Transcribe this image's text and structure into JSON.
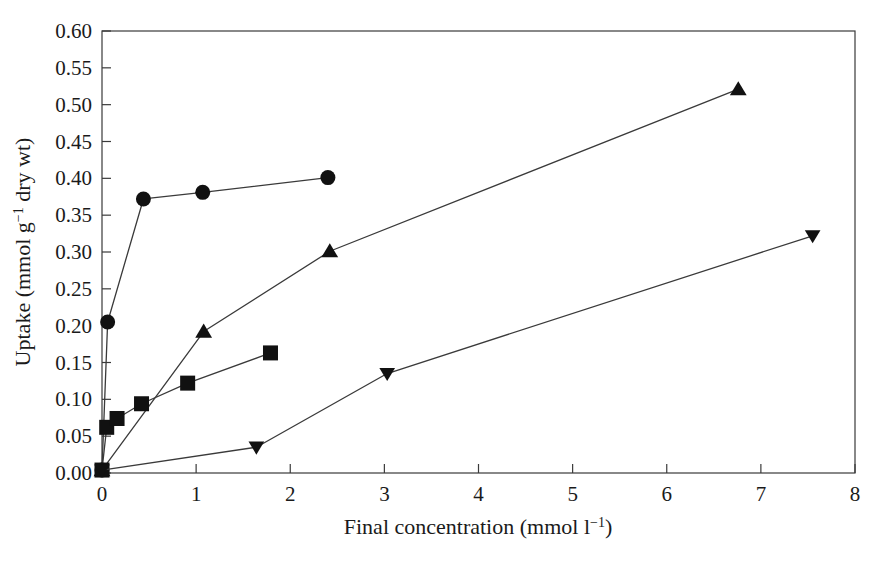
{
  "figure": {
    "background_color": "#ffffff",
    "ink_color": "#111111",
    "axis_color": "#3a3a3a"
  },
  "chart_data": {
    "type": "line",
    "title": "",
    "subtitle": "",
    "xlabel": "Final concentration (mmol l",
    "xlabel_sup": "−1",
    "xlabel_tail": ")",
    "xlabel_full": "Final concentration (mmol l⁻¹)",
    "ylabel_head": "Uptake (mmol g",
    "ylabel_sup": "−1",
    "ylabel_tail": " dry wt)",
    "ylabel_full": "Uptake (mmol g⁻¹ dry wt)",
    "xlim": [
      0,
      8
    ],
    "ylim": [
      0.0,
      0.6
    ],
    "xticks": [
      0,
      1,
      2,
      3,
      4,
      5,
      6,
      7,
      8
    ],
    "xtick_labels": [
      "0",
      "1",
      "2",
      "3",
      "4",
      "5",
      "6",
      "7",
      "8"
    ],
    "yticks": [
      0.0,
      0.05,
      0.1,
      0.15,
      0.2,
      0.25,
      0.3,
      0.35,
      0.4,
      0.45,
      0.5,
      0.55,
      0.6
    ],
    "ytick_labels": [
      "0.00",
      "0.05",
      "0.10",
      "0.15",
      "0.20",
      "0.25",
      "0.30",
      "0.35",
      "0.40",
      "0.45",
      "0.50",
      "0.55",
      "0.60"
    ],
    "grid": false,
    "legend": "none",
    "frame": "box",
    "series": [
      {
        "name": "circle-series",
        "marker": "circle",
        "marker_size": 15,
        "color": "#111111",
        "x": [
          0.0,
          0.06,
          0.44,
          1.07,
          2.4
        ],
        "y": [
          0.004,
          0.205,
          0.372,
          0.381,
          0.401
        ]
      },
      {
        "name": "triangle-up-series",
        "marker": "triangle-up",
        "marker_size": 15,
        "color": "#111111",
        "x": [
          0.0,
          1.08,
          2.42,
          6.76
        ],
        "y": [
          0.004,
          0.192,
          0.301,
          0.521
        ]
      },
      {
        "name": "square-series",
        "marker": "square",
        "marker_size": 15,
        "color": "#111111",
        "x": [
          0.0,
          0.05,
          0.16,
          0.42,
          0.91,
          1.79
        ],
        "y": [
          0.004,
          0.062,
          0.074,
          0.094,
          0.122,
          0.163
        ]
      },
      {
        "name": "triangle-down-series",
        "marker": "triangle-down",
        "marker_size": 14,
        "color": "#111111",
        "x": [
          0.0,
          1.64,
          3.03,
          7.55
        ],
        "y": [
          0.004,
          0.035,
          0.135,
          0.322
        ]
      }
    ]
  }
}
